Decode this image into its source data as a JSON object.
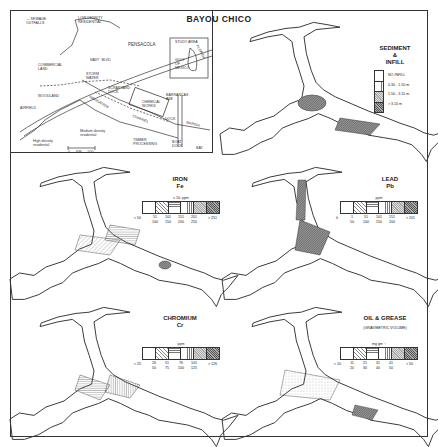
{
  "figure": {
    "title": "BAYOU CHICO"
  },
  "inset_map": {
    "legend": {
      "symbol": "arrow",
      "label": "SEWAGE\nOUTFALLS"
    },
    "labels": [
      {
        "text": "Low density\nresidential",
        "x": 78,
        "y": 16
      },
      {
        "text": "PENSACOLA",
        "x": 128,
        "y": 43
      },
      {
        "text": "NAVY  BLVD",
        "x": 90,
        "y": 60
      },
      {
        "text": "COMMERCIAL\nLAND",
        "x": 42,
        "y": 63
      },
      {
        "text": "STORM\nWATER",
        "x": 86,
        "y": 73
      },
      {
        "text": "SCRAPYARD\nDOCK",
        "x": 108,
        "y": 87
      },
      {
        "text": "WOODLAND",
        "x": 40,
        "y": 93
      },
      {
        "text": "AIRFIELD",
        "x": 20,
        "y": 105
      },
      {
        "text": "NAVIGATION",
        "x": 88,
        "y": 100
      },
      {
        "text": "CHEMICAL\nWORKS",
        "x": 142,
        "y": 100
      },
      {
        "text": "CHANNEL",
        "x": 135,
        "y": 118
      },
      {
        "text": "BARRANCAS\nAVE",
        "x": 166,
        "y": 93
      },
      {
        "text": "DOCK",
        "x": 165,
        "y": 117
      },
      {
        "text": "MARINA",
        "x": 187,
        "y": 124
      },
      {
        "text": "Medium density\nresidential",
        "x": 80,
        "y": 130
      },
      {
        "text": "High density\nresidential",
        "x": 33,
        "y": 142
      },
      {
        "text": "TIMBER\nPROCESSING",
        "x": 133,
        "y": 141
      },
      {
        "text": "BOAT\nDOCK",
        "x": 172,
        "y": 142
      },
      {
        "text": "BAY",
        "x": 198,
        "y": 148
      }
    ],
    "scale_bar": {
      "start": "0",
      "unit": "km",
      "end": "500"
    },
    "locator": {
      "labels": [
        "STUDY AREA",
        "FLORIDA",
        "GULF\nOF\nMEXICO"
      ]
    }
  },
  "panels": {
    "sediment": {
      "title": "SEDIMENT\n&\nINFILL",
      "legend": [
        {
          "pattern": "blank",
          "label": "NO INFILL"
        },
        {
          "pattern": "vertical-lines",
          "label": "0.30 - 1.50 m"
        },
        {
          "pattern": "light-stipple",
          "label": "1.50 - 3.10 m"
        },
        {
          "pattern": "dense-crosshatch",
          "label": "> 3.10 m"
        }
      ]
    },
    "iron": {
      "title": "IRON\nFe",
      "unit": "x 10³ ppm",
      "ticks": [
        "< 50",
        "51\n100",
        "101\n150",
        "151\n200",
        "201\n250",
        "> 251"
      ]
    },
    "lead": {
      "title": "LEAD\nPb",
      "unit": "ppm",
      "ticks": [
        "0",
        "1\n50",
        "51\n100",
        "101\n150",
        "151\n200",
        "> 201"
      ]
    },
    "chromium": {
      "title": "CHROMIUM\nCr",
      "unit": "ppm",
      "ticks": [
        "< 25",
        "26\n50",
        "51\n75",
        "76\n100",
        "101\n125",
        "> 126"
      ]
    },
    "oil_grease": {
      "title": "OIL & GREASE",
      "subtitle": "(GRAVIMETRIC VOLUME)",
      "unit": "mg gm⁻¹",
      "ticks": [
        "< 10",
        "11\n20",
        "21\n30",
        "31\n40",
        "41\n50",
        "> 50"
      ]
    }
  },
  "colors": {
    "ink": "#222222",
    "paper": "#ffffff"
  }
}
